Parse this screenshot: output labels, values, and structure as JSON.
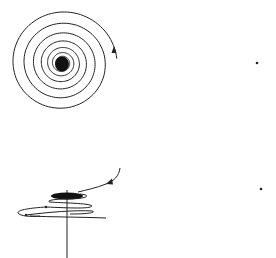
{
  "figures": [
    {
      "id": "spiral-top-view",
      "description": "Inward spiral trajectory (phase-plane view) converging to a stable focus",
      "center": [
        62,
        63
      ],
      "arrow": {
        "at": [
          114,
          51
        ],
        "direction": "up"
      },
      "marker_dot": [
        257,
        63
      ]
    },
    {
      "id": "spiral-side-view",
      "description": "Side/perspective view of a decaying helical trajectory around a vertical axis",
      "axis_vertical_x": 67,
      "arrow": {
        "at": [
          109,
          183
        ],
        "direction": "down-left"
      },
      "marker_dot": [
        261,
        189
      ]
    }
  ],
  "colors": {
    "ink": "#222222",
    "background": "#ffffff"
  }
}
